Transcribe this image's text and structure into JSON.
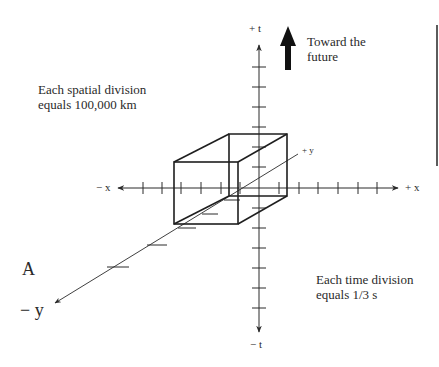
{
  "diagram": {
    "notes": {
      "spatial_line1": "Each spatial division",
      "spatial_line2": "equals 100,000 km",
      "time_line1": "Each time division",
      "time_line2": "equals 1/3 s",
      "future_line1": "Toward the",
      "future_line2": "future"
    },
    "axis_labels": {
      "plus_t": "+ t",
      "minus_t": "− t",
      "minus_x": "− x",
      "plus_x": "+ x",
      "plus_y": "+ y",
      "minus_y": "− y"
    },
    "panel_label": "A",
    "colors": {
      "line": "#2a2a2a",
      "background": "#ffffff"
    }
  }
}
